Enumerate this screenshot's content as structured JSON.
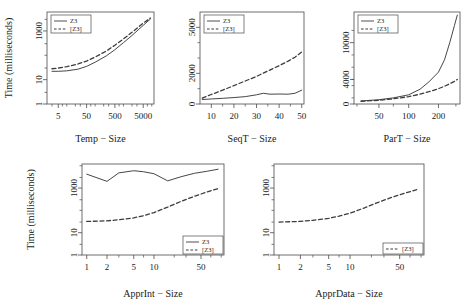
{
  "figure": {
    "shared_ylabel": "Time (milliseconds)",
    "legend": {
      "solid_label": "Z3",
      "dashed_label": "[Z3]"
    },
    "colors": {
      "line": "#3c3c3c",
      "axis": "#4a4a4a",
      "background": "#ffffff"
    }
  },
  "chart_data": [
    {
      "type": "line",
      "title": "",
      "xlabel": "Temp − Size",
      "ylabel": "Time (milliseconds)",
      "xscale": "log",
      "yscale": "log",
      "xlim": [
        2,
        12000
      ],
      "ylim": [
        1,
        6000
      ],
      "xticks": [
        5,
        50,
        500,
        5000
      ],
      "xticklabels": [
        "5",
        "50",
        "500",
        "5000"
      ],
      "yticks": [
        1,
        10,
        1000
      ],
      "yticklabels": [
        "1",
        "10",
        "1000"
      ],
      "grid": false,
      "legend_position": "top-left",
      "series": [
        {
          "name": "Z3",
          "style": "solid",
          "x": [
            3,
            5,
            10,
            25,
            50,
            100,
            250,
            500,
            1000,
            2000,
            5000,
            9000
          ],
          "values": [
            22,
            22,
            23,
            27,
            35,
            52,
            95,
            170,
            330,
            650,
            1700,
            3100
          ]
        },
        {
          "name": "[Z3]",
          "style": "dashed",
          "x": [
            3,
            5,
            10,
            25,
            50,
            100,
            250,
            500,
            1000,
            2000,
            5000,
            9000
          ],
          "values": [
            28,
            30,
            34,
            44,
            58,
            85,
            150,
            260,
            470,
            880,
            2100,
            3400
          ]
        }
      ]
    },
    {
      "type": "line",
      "title": "",
      "xlabel": "SeqT − Size",
      "ylabel": "",
      "xscale": "linear",
      "yscale": "linear",
      "xlim": [
        5,
        51
      ],
      "ylim": [
        0,
        6000
      ],
      "xticks": [
        10,
        20,
        30,
        40,
        50
      ],
      "xticklabels": [
        "10",
        "20",
        "30",
        "40",
        "50"
      ],
      "yticks": [
        0,
        2000,
        5000
      ],
      "yticklabels": [
        "0",
        "2000",
        "5000"
      ],
      "grid": false,
      "legend_position": "top-left",
      "series": [
        {
          "name": "Z3",
          "style": "solid",
          "x": [
            6,
            10,
            15,
            20,
            25,
            30,
            33,
            36,
            40,
            44,
            47,
            50
          ],
          "values": [
            290,
            330,
            370,
            420,
            480,
            600,
            700,
            640,
            650,
            640,
            700,
            900
          ]
        },
        {
          "name": "[Z3]",
          "style": "dashed",
          "x": [
            6,
            10,
            15,
            20,
            25,
            30,
            35,
            40,
            44,
            47,
            50
          ],
          "values": [
            380,
            620,
            900,
            1200,
            1500,
            1800,
            2150,
            2500,
            2800,
            3050,
            3400
          ]
        }
      ]
    },
    {
      "type": "line",
      "title": "",
      "xlabel": "ParT − Size",
      "ylabel": "",
      "xscale": "log",
      "yscale": "linear",
      "xlim": [
        28,
        330
      ],
      "ylim": [
        0,
        15000
      ],
      "xticks": [
        50,
        100,
        200
      ],
      "xticklabels": [
        "50",
        "100",
        "200"
      ],
      "yticks": [
        0,
        4000,
        10000
      ],
      "yticklabels": [
        "0",
        "4000",
        "10000"
      ],
      "grid": false,
      "legend_position": "top-left",
      "series": [
        {
          "name": "Z3",
          "style": "solid",
          "x": [
            33,
            50,
            70,
            100,
            130,
            160,
            200,
            230,
            260,
            290,
            310
          ],
          "values": [
            500,
            700,
            1000,
            1500,
            2400,
            3600,
            5200,
            7200,
            10000,
            12800,
            14500
          ]
        },
        {
          "name": "[Z3]",
          "style": "dashed",
          "x": [
            33,
            50,
            70,
            100,
            130,
            160,
            200,
            230,
            260,
            290,
            310
          ],
          "values": [
            450,
            600,
            850,
            1200,
            1600,
            2000,
            2500,
            2900,
            3300,
            3700,
            4000
          ]
        }
      ]
    },
    {
      "type": "line",
      "title": "",
      "xlabel": "ApprInt − Size",
      "ylabel": "Time (milliseconds)",
      "xscale": "log",
      "yscale": "log",
      "xlim": [
        0.85,
        110
      ],
      "ylim": [
        1,
        12000
      ],
      "xticks": [
        1,
        2,
        5,
        10,
        50
      ],
      "xticklabels": [
        "1",
        "2",
        "5",
        "10",
        "50"
      ],
      "yticks": [
        1,
        10,
        1000
      ],
      "yticklabels": [
        "1",
        "10",
        "1000"
      ],
      "grid": false,
      "legend_position": "bottom-right",
      "series": [
        {
          "name": "Z3",
          "style": "solid",
          "x": [
            1,
            2,
            3,
            5,
            7,
            10,
            16,
            25,
            40,
            60,
            90
          ],
          "values": [
            4200,
            2000,
            4800,
            6000,
            5400,
            4400,
            2100,
            3200,
            4600,
            5600,
            7000
          ]
        },
        {
          "name": "[Z3]",
          "style": "dashed",
          "x": [
            1,
            2,
            3,
            5,
            7,
            10,
            16,
            25,
            40,
            60,
            90
          ],
          "values": [
            32,
            34,
            38,
            46,
            58,
            80,
            140,
            250,
            430,
            650,
            950
          ]
        }
      ]
    },
    {
      "type": "line",
      "title": "",
      "xlabel": "ApprData − Size",
      "ylabel": "",
      "xscale": "log",
      "yscale": "log",
      "xlim": [
        0.85,
        110
      ],
      "ylim": [
        1,
        12000
      ],
      "xticks": [
        1,
        2,
        5,
        10,
        50
      ],
      "xticklabels": [
        "1",
        "2",
        "5",
        "10",
        "50"
      ],
      "yticks": [
        1,
        10,
        1000
      ],
      "yticklabels": [
        "1",
        "10",
        "1000"
      ],
      "grid": false,
      "legend_position": "bottom-right",
      "series": [
        {
          "name": "[Z3]",
          "style": "dashed",
          "x": [
            1,
            2,
            3,
            5,
            7,
            10,
            16,
            25,
            40,
            60,
            90
          ],
          "values": [
            30,
            32,
            36,
            44,
            55,
            75,
            130,
            230,
            400,
            600,
            880
          ]
        }
      ]
    }
  ]
}
